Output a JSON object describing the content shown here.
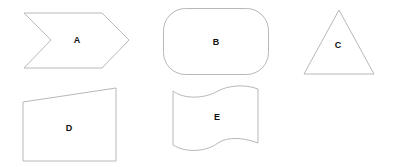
{
  "diagram": {
    "shapes": [
      {
        "id": "A",
        "type": "chevron",
        "label": "A"
      },
      {
        "id": "B",
        "type": "rounded-rectangle",
        "label": "B"
      },
      {
        "id": "C",
        "type": "triangle",
        "label": "C"
      },
      {
        "id": "D",
        "type": "trapezoid",
        "label": "D"
      },
      {
        "id": "E",
        "type": "wave",
        "label": "E"
      }
    ],
    "colors": {
      "stroke": "#b8b8b8",
      "fill": "#ffffff",
      "text": "#111111"
    }
  }
}
